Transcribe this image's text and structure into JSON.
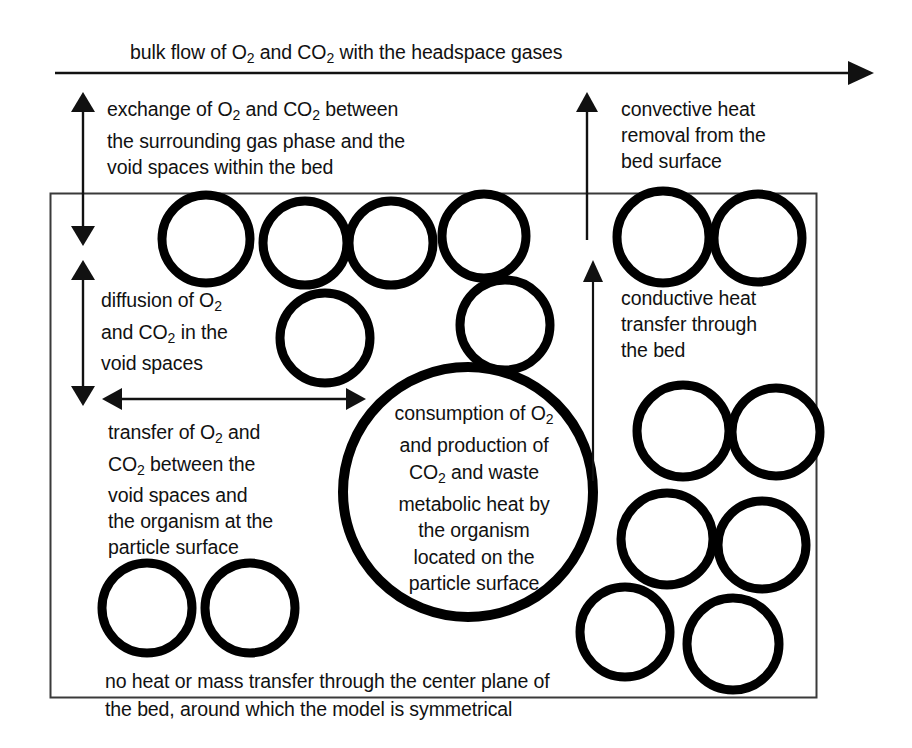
{
  "figure": {
    "type": "schematic-diagram",
    "bed_box": {
      "name": "bed-boundary-box",
      "x": 50,
      "y": 193,
      "width": 766,
      "height": 504,
      "stroke": "#333333",
      "fill": "#ffffff"
    },
    "colors": {
      "line": "#111111",
      "particle_outline": "#000000",
      "box_outline": "#3a3a3a",
      "background": "#ffffff",
      "text": "#111111"
    }
  },
  "labels": {
    "bulk_flow": {
      "id": "bulk-flow",
      "text": "bulk flow of O₂ and CO₂ with the headspace gases",
      "html": "bulk flow of O<sub>2</sub> and CO<sub>2</sub> with the headspace gases"
    },
    "exchange": {
      "id": "exchange",
      "text": "exchange of O₂ and CO₂ between the surrounding gas phase and the void spaces within the bed",
      "html": "exchange of O<sub>2</sub> and CO<sub>2</sub> between<br>the surrounding gas phase and the<br>void spaces within the bed"
    },
    "convective": {
      "id": "convective-heat",
      "text": "convective heat removal from the bed surface",
      "html": "convective heat<br>removal from the<br>bed surface"
    },
    "diffusion": {
      "id": "diffusion",
      "text": "diffusion of O₂ and CO₂ in the void spaces",
      "html": "diffusion of O<sub>2</sub><br>and CO<sub>2</sub> in the<br>void spaces"
    },
    "conductive": {
      "id": "conductive-heat",
      "text": "conductive heat transfer through the bed",
      "html": "conductive heat<br>transfer through<br>the bed"
    },
    "transfer": {
      "id": "transfer-void-organism",
      "text": "transfer of O₂ and CO₂ between the void spaces and the organism at the particle surface",
      "html": "transfer of O<sub>2</sub> and<br>CO<sub>2</sub> between the<br>void spaces and<br>the organism at the<br>particle surface"
    },
    "consumption": {
      "id": "consumption-production",
      "text": "consumption of O₂ and production of CO₂ and waste metabolic heat by the organism located on the particle surface",
      "html": "consumption of O<sub>2</sub><br>and production of<br>CO<sub>2</sub> and waste<br>metabolic heat by<br>the organism<br>located on the<br>particle surface"
    },
    "bottom": {
      "id": "center-plane-note",
      "text": "no heat or mass transfer through the center plane of the bed, around which the model is symmetrical",
      "html": "no heat or mass transfer through the center plane of<br>the bed, around which the model is symmetrical"
    }
  },
  "arrows": [
    {
      "name": "bulk-flow-arrow",
      "direction": "right",
      "x1": 55,
      "y1": 73,
      "x2": 870,
      "y2": 73,
      "head": "end"
    },
    {
      "name": "exchange-arrow",
      "direction": "vertical-both",
      "x1": 83,
      "y1": 104,
      "x2": 83,
      "y2": 238,
      "head": "both"
    },
    {
      "name": "convective-heat-arrow",
      "direction": "up",
      "x1": 587,
      "y1": 236,
      "x2": 587,
      "y2": 101,
      "head": "end"
    },
    {
      "name": "diffusion-arrow",
      "direction": "vertical-both",
      "x1": 83,
      "y1": 268,
      "x2": 83,
      "y2": 396,
      "head": "both"
    },
    {
      "name": "transfer-arrow",
      "direction": "horizontal-both",
      "x1": 110,
      "y1": 399,
      "x2": 350,
      "y2": 399,
      "head": "both"
    },
    {
      "name": "conductive-heat-arrow",
      "direction": "up",
      "x1": 593,
      "y1": 481,
      "x2": 593,
      "y2": 262,
      "head": "end"
    }
  ],
  "particles": [
    {
      "name": "particle-large-center",
      "cx": 468,
      "cy": 492,
      "r": 125,
      "stroke": 9
    },
    {
      "name": "particle-1",
      "cx": 206,
      "cy": 239,
      "r": 44,
      "stroke": 8
    },
    {
      "name": "particle-2",
      "cx": 305,
      "cy": 243,
      "r": 42,
      "stroke": 8
    },
    {
      "name": "particle-3",
      "cx": 391,
      "cy": 243,
      "r": 42,
      "stroke": 8
    },
    {
      "name": "particle-4",
      "cx": 484,
      "cy": 236,
      "r": 42,
      "stroke": 8
    },
    {
      "name": "particle-5",
      "cx": 663,
      "cy": 237,
      "r": 46,
      "stroke": 8
    },
    {
      "name": "particle-6",
      "cx": 758,
      "cy": 238,
      "r": 44,
      "stroke": 8
    },
    {
      "name": "particle-7",
      "cx": 325,
      "cy": 338,
      "r": 45,
      "stroke": 8
    },
    {
      "name": "particle-8",
      "cx": 505,
      "cy": 325,
      "r": 45,
      "stroke": 8
    },
    {
      "name": "particle-9",
      "cx": 683,
      "cy": 431,
      "r": 46,
      "stroke": 8
    },
    {
      "name": "particle-10",
      "cx": 776,
      "cy": 432,
      "r": 44,
      "stroke": 8
    },
    {
      "name": "particle-11",
      "cx": 667,
      "cy": 539,
      "r": 46,
      "stroke": 8
    },
    {
      "name": "particle-12",
      "cx": 762,
      "cy": 545,
      "r": 44,
      "stroke": 8
    },
    {
      "name": "particle-13",
      "cx": 625,
      "cy": 632,
      "r": 45,
      "stroke": 8
    },
    {
      "name": "particle-14",
      "cx": 733,
      "cy": 644,
      "r": 46,
      "stroke": 8
    },
    {
      "name": "particle-15",
      "cx": 147,
      "cy": 608,
      "r": 45,
      "stroke": 8
    },
    {
      "name": "particle-16",
      "cx": 250,
      "cy": 608,
      "r": 45,
      "stroke": 8
    }
  ]
}
